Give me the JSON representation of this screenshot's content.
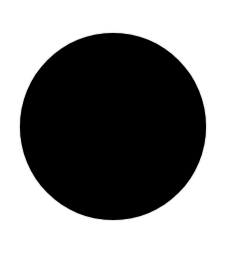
{
  "image": {
    "background_color": "#ffffff",
    "shape": {
      "type": "filled-circle",
      "color": "#000000"
    }
  }
}
